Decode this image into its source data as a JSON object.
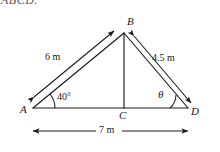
{
  "figure": {
    "clipped_heading": "ABCD.",
    "vertices": [
      {
        "name": "A",
        "label": "A",
        "x": 33,
        "y": 108
      },
      {
        "name": "B",
        "label": "B",
        "x": 124,
        "y": 33
      },
      {
        "name": "C",
        "label": "C",
        "x": 124,
        "y": 108
      },
      {
        "name": "D",
        "label": "D",
        "x": 188,
        "y": 108
      }
    ],
    "side_labels": [
      {
        "name": "side-ab-length",
        "text": "6 m",
        "x": 57,
        "y": 57
      },
      {
        "name": "side-bd-length",
        "text": "4.5 m",
        "x": 150,
        "y": 57
      },
      {
        "name": "side-ad-length",
        "text": "7 m",
        "x": 102,
        "y": 125
      }
    ],
    "angle_labels": [
      {
        "name": "angle-at-a",
        "text": "40°",
        "x": 56,
        "y": 96
      },
      {
        "name": "angle-at-d",
        "text": "θ",
        "x": 159,
        "y": 92
      }
    ],
    "colors": {
      "stroke": "#1a1a1a",
      "background": "#ffffff",
      "text": "#1a1a1a"
    }
  }
}
